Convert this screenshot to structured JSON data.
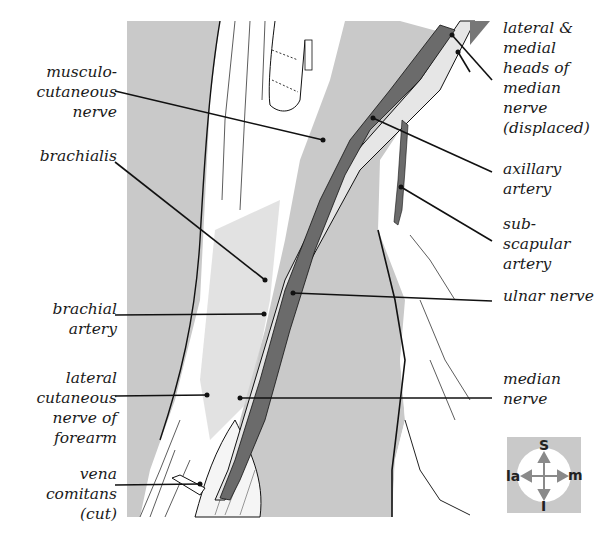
{
  "figure": {
    "type": "anatomical illustration",
    "colors": {
      "background": "#ffffff",
      "field_gray": "#c9c9c9",
      "artery_dark": "#6b6b6b",
      "nerve_light": "#e6e6e6",
      "line": "#111111"
    }
  },
  "labels_left": [
    {
      "id": "musculocutaneous",
      "text": "musculo-\ncutaneous\nnerve"
    },
    {
      "id": "brachialis",
      "text": "brachialis"
    },
    {
      "id": "brachial-artery",
      "text": "brachial\nartery"
    },
    {
      "id": "lateral-cutaneous",
      "text": "lateral\ncutaneous\nnerve of\nforearm"
    },
    {
      "id": "vena-comitans",
      "text": "vena\ncomitans\n(cut)"
    }
  ],
  "labels_right": [
    {
      "id": "median-heads",
      "text": "lateral &\nmedial\nheads of\nmedian\nnerve\n(displaced)"
    },
    {
      "id": "axillary-artery",
      "text": "axillary\nartery"
    },
    {
      "id": "subscapular-artery",
      "text": "sub-\nscapular\nartery"
    },
    {
      "id": "ulnar-nerve",
      "text": "ulnar nerve"
    },
    {
      "id": "median-nerve",
      "text": "median\nnerve"
    }
  ],
  "orientation_key": {
    "superior": "S",
    "inferior": "I",
    "lateral": "la",
    "medial": "m"
  }
}
